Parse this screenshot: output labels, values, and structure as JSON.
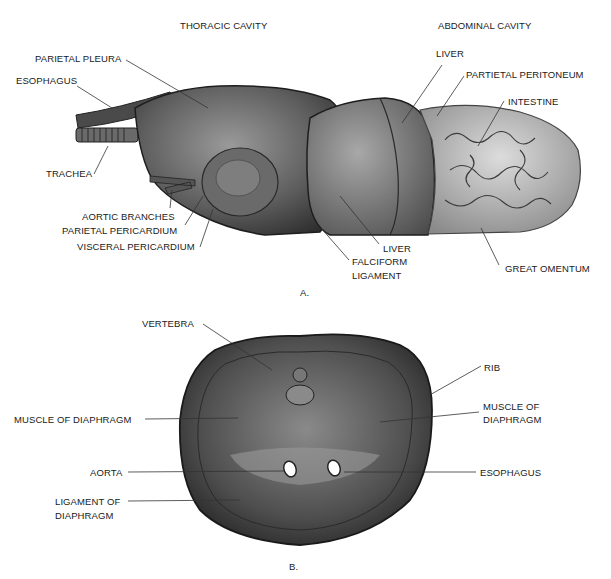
{
  "figure_a": {
    "panel_label": "A.",
    "headings": {
      "thoracic": "THORACIC CAVITY",
      "abdominal": "ABDOMINAL CAVITY"
    },
    "labels": {
      "parietal_pleura": "PARIETAL PLEURA",
      "esophagus": "ESOPHAGUS",
      "trachea": "TRACHEA",
      "aortic_branches": "AORTIC BRANCHES",
      "parietal_pericardium": "PARIETAL PERICARDIUM",
      "visceral_pericardium": "VISCERAL PERICARDIUM",
      "liver_top": "LIVER",
      "partietal_peritoneum": "PARTIETAL PERITONEUM",
      "intestine": "INTESTINE",
      "liver_bottom": "LIVER",
      "falciform_ligament_1": "FALCIFORM",
      "falciform_ligament_2": "LIGAMENT",
      "great_omentum": "GREAT OMENTUM"
    }
  },
  "figure_b": {
    "panel_label": "B.",
    "labels": {
      "vertebra": "VERTEBRA",
      "rib": "RIB",
      "muscle_left": "MUSCLE OF DIAPHRAGM",
      "muscle_right_1": "MUSCLE OF",
      "muscle_right_2": "DIAPHRAGM",
      "aorta": "AORTA",
      "esophagus": "ESOPHAGUS",
      "ligament_1": "LIGAMENT OF",
      "ligament_2": "DIAPHRAGM"
    }
  }
}
